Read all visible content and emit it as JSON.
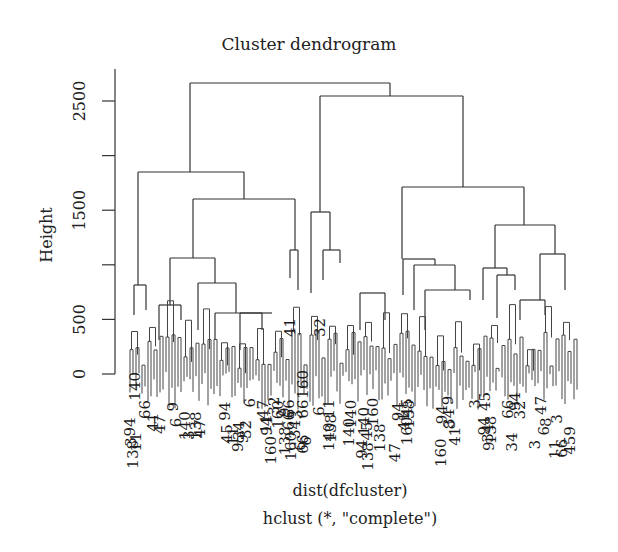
{
  "chart_data": {
    "type": "dendrogram",
    "title": "Cluster dendrogram",
    "ylabel": "Height",
    "xlabel": "dist(dfcluster)",
    "sublabel": "hclust (*, \"complete\")",
    "ylim": [
      0,
      2800
    ],
    "yticks": [
      0,
      500,
      1000,
      1500,
      2000,
      2500
    ],
    "ytick_labels": [
      "0",
      "500",
      "",
      "1500",
      "",
      "2500"
    ],
    "grid": false,
    "method": "complete",
    "visible_leaf_labels": [
      "140",
      "138",
      "66",
      "9",
      "47",
      "41",
      "160",
      "32",
      "34",
      "45",
      "94",
      "6",
      "8",
      "11",
      "3"
    ],
    "top_merges": [
      {
        "name": "root",
        "height": 2665,
        "x_left": 190,
        "x_right": 390
      },
      {
        "name": "right-cluster",
        "height": 2546,
        "x_left": 320,
        "x_right": 463
      },
      {
        "name": "left-cluster",
        "height": 1850,
        "x_left": 138,
        "x_right": 244
      },
      {
        "name": "left-sub",
        "height": 1600,
        "x_left": 193,
        "x_right": 295
      },
      {
        "name": "right-sub-a",
        "height": 1710,
        "x_left": 402,
        "x_right": 524
      },
      {
        "name": "right-sub-b",
        "height": 1370,
        "x_left": 495,
        "x_right": 555
      },
      {
        "name": "mid-a",
        "height": 1480,
        "x_left": 311,
        "x_right": 330
      },
      {
        "name": "mid-b",
        "height": 1110,
        "x_left": 324,
        "x_right": 340
      }
    ]
  },
  "plot": {
    "origin_y": 374,
    "px_per_unit": 0.1092,
    "axis_x": 115,
    "axis_top": 69,
    "leaf_bottom": 400
  },
  "tree": {
    "segments": [
      [
        190,
        83,
        390,
        83
      ],
      [
        190,
        83,
        190,
        172
      ],
      [
        390,
        83,
        390,
        96
      ],
      [
        320,
        96,
        463,
        96
      ],
      [
        320,
        96,
        320,
        212
      ],
      [
        463,
        96,
        463,
        187
      ],
      [
        138,
        172,
        244,
        172
      ],
      [
        138,
        172,
        138,
        285
      ],
      [
        244,
        172,
        244,
        199
      ],
      [
        193,
        199,
        295,
        199
      ],
      [
        193,
        199,
        193,
        258
      ],
      [
        295,
        199,
        295,
        250
      ],
      [
        402,
        187,
        524,
        187
      ],
      [
        402,
        187,
        402,
        259
      ],
      [
        524,
        187,
        524,
        225
      ],
      [
        495,
        225,
        555,
        225
      ],
      [
        495,
        225,
        495,
        268
      ],
      [
        555,
        225,
        555,
        254
      ],
      [
        311,
        212,
        330,
        212
      ],
      [
        311,
        212,
        311,
        293
      ],
      [
        330,
        212,
        330,
        250
      ],
      [
        323,
        250,
        340,
        250
      ],
      [
        323,
        250,
        323,
        280
      ],
      [
        340,
        250,
        340,
        263
      ],
      [
        290,
        250,
        298,
        250
      ],
      [
        290,
        250,
        290,
        278
      ],
      [
        298,
        250,
        298,
        290
      ],
      [
        134,
        285,
        146,
        285
      ],
      [
        134,
        285,
        134,
        315
      ],
      [
        146,
        285,
        146,
        310
      ],
      [
        170,
        258,
        215,
        258
      ],
      [
        170,
        258,
        170,
        305
      ],
      [
        215,
        258,
        215,
        283
      ],
      [
        198,
        283,
        236,
        283
      ],
      [
        198,
        283,
        198,
        330
      ],
      [
        236,
        283,
        236,
        313
      ],
      [
        159,
        305,
        181,
        305
      ],
      [
        159,
        305,
        159,
        340
      ],
      [
        181,
        305,
        181,
        320
      ],
      [
        215,
        313,
        262,
        313
      ],
      [
        215,
        313,
        215,
        340
      ],
      [
        262,
        313,
        262,
        330
      ],
      [
        240,
        313,
        272,
        313
      ],
      [
        240,
        313,
        240,
        350
      ],
      [
        403,
        259,
        435,
        259
      ],
      [
        403,
        259,
        403,
        295
      ],
      [
        435,
        259,
        435,
        265
      ],
      [
        414,
        265,
        455,
        265
      ],
      [
        414,
        265,
        414,
        310
      ],
      [
        455,
        265,
        455,
        290
      ],
      [
        425,
        290,
        470,
        290
      ],
      [
        425,
        290,
        425,
        330
      ],
      [
        470,
        290,
        470,
        300
      ],
      [
        360,
        293,
        385,
        293
      ],
      [
        360,
        293,
        360,
        330
      ],
      [
        385,
        293,
        385,
        320
      ],
      [
        483,
        268,
        507,
        268
      ],
      [
        483,
        268,
        483,
        300
      ],
      [
        507,
        268,
        507,
        275
      ],
      [
        497,
        275,
        515,
        275
      ],
      [
        497,
        275,
        497,
        318
      ],
      [
        515,
        275,
        515,
        290
      ],
      [
        540,
        254,
        565,
        254
      ],
      [
        540,
        254,
        540,
        300
      ],
      [
        565,
        254,
        565,
        290
      ],
      [
        520,
        300,
        545,
        300
      ],
      [
        520,
        300,
        520,
        320
      ],
      [
        545,
        300,
        545,
        315
      ]
    ],
    "leaf_count": 150,
    "leaf_x_start": 130,
    "leaf_x_end": 580
  }
}
